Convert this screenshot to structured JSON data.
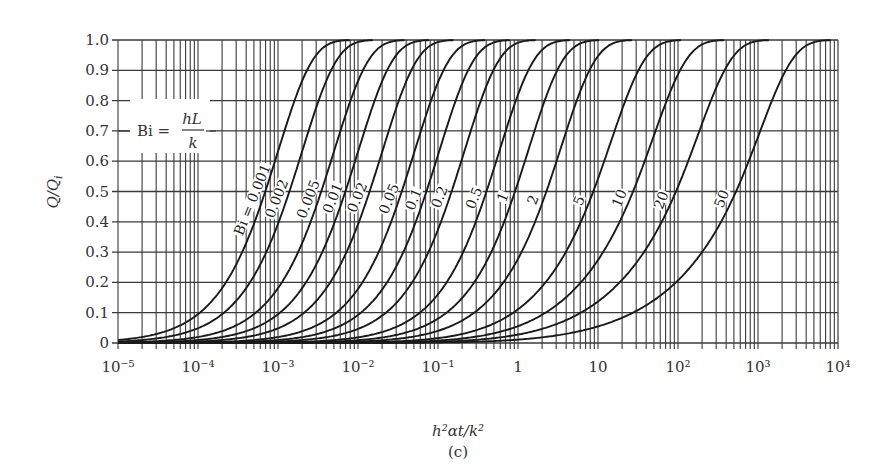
{
  "chart_data": {
    "type": "line",
    "title": "",
    "subtitle": "(c)",
    "xlabel": "h²αt/k²",
    "ylabel": "Q/Qᵢ",
    "xscale": "log",
    "xlim": [
      1e-05,
      10000
    ],
    "ylim": [
      0,
      1.0
    ],
    "grid": true,
    "legend": "none",
    "x_ticks": [
      "10⁻⁵",
      "10⁻⁴",
      "10⁻³",
      "10⁻²",
      "10⁻¹",
      "1",
      "10",
      "10²",
      "10³",
      "10⁴"
    ],
    "y_ticks": [
      "0",
      "0.1",
      "0.2",
      "0.3",
      "0.4",
      "0.5",
      "0.6",
      "0.7",
      "0.8",
      "0.9",
      "1.0"
    ],
    "annotation": "Bi = hL/k",
    "series": [
      {
        "name": "Bi = 0.001",
        "label": "Bi = 0.001",
        "bi": 0.001
      },
      {
        "name": "0.002",
        "label": "0.002",
        "bi": 0.002
      },
      {
        "name": "0.005",
        "label": "0.005",
        "bi": 0.005
      },
      {
        "name": "0.01",
        "label": "0.01",
        "bi": 0.01
      },
      {
        "name": "0.02",
        "label": "0.02",
        "bi": 0.02
      },
      {
        "name": "0.05",
        "label": "0.05",
        "bi": 0.05
      },
      {
        "name": "0.1",
        "label": "0.1",
        "bi": 0.1
      },
      {
        "name": "0.2",
        "label": "0.2",
        "bi": 0.2
      },
      {
        "name": "0.5",
        "label": "0.5",
        "bi": 0.5
      },
      {
        "name": "1",
        "label": "1",
        "bi": 1
      },
      {
        "name": "2",
        "label": "2",
        "bi": 2
      },
      {
        "name": "5",
        "label": "5",
        "bi": 5
      },
      {
        "name": "10",
        "label": "10",
        "bi": 10
      },
      {
        "name": "20",
        "label": "20",
        "bi": 20
      },
      {
        "name": "50",
        "label": "50",
        "bi": 50
      }
    ],
    "approx_x_at_half": {
      "0.001": 0.0009,
      "0.002": 0.0018,
      "0.005": 0.0045,
      "0.01": 0.009,
      "0.02": 0.018,
      "0.05": 0.045,
      "0.1": 0.09,
      "0.2": 0.19,
      "0.5": 0.5,
      "1": 1.1,
      "2": 2.8,
      "5": 10,
      "10": 30,
      "20": 90,
      "50": 450
    }
  },
  "labels": {
    "bi_annotation_left": "Bi =",
    "bi_annotation_num": "hL",
    "bi_annotation_den": "k",
    "xlabel": "h²αt/k²",
    "caption": "(c)",
    "ylabel_main": "Q/Q",
    "ylabel_sub": "i"
  },
  "colors": {
    "curve": "#1a1a1a",
    "grid": "#3a3a3a",
    "text": "#333333",
    "background": "#ffffff"
  }
}
